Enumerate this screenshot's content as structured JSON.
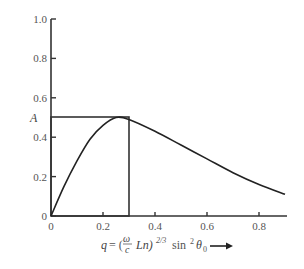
{
  "chart_data": {
    "type": "line",
    "title": "",
    "xlabel": "q = (ω/c Ln)^(2/3) sin² θ0",
    "ylabel": "A",
    "xlim": [
      0,
      0.9
    ],
    "ylim": [
      0,
      1.0
    ],
    "x_ticks": [
      "0",
      "0.2",
      "0.4",
      "0.6",
      "0.8"
    ],
    "y_ticks": [
      "0",
      "0.2",
      "0.4",
      "0.6",
      "0.8",
      "1.0"
    ],
    "grid": false,
    "legend": null,
    "series": [
      {
        "name": "A(q)",
        "x": [
          0,
          0.05,
          0.1,
          0.15,
          0.2,
          0.25,
          0.3,
          0.4,
          0.5,
          0.6,
          0.7,
          0.8,
          0.9
        ],
        "y": [
          0,
          0.15,
          0.28,
          0.39,
          0.46,
          0.5,
          0.49,
          0.43,
          0.36,
          0.29,
          0.22,
          0.16,
          0.11
        ]
      }
    ],
    "annotations": [
      {
        "type": "rectangle",
        "x0": 0,
        "x1": 0.3,
        "y0": 0,
        "y1": 0.5,
        "description": "step approximation box"
      },
      {
        "type": "arrow",
        "description": "arrow pointing right after x-axis label"
      }
    ]
  },
  "labels": {
    "y_axis": "A",
    "x_axis_q": "q",
    "x_axis_eq": "= (",
    "x_axis_omega": "ω",
    "x_axis_c": "c",
    "x_axis_ln": "Ln)",
    "x_axis_exp": "2/3",
    "x_axis_sin": "sin",
    "x_axis_sin_exp": "2",
    "x_axis_theta": "θ",
    "x_axis_theta_sub": "0"
  }
}
